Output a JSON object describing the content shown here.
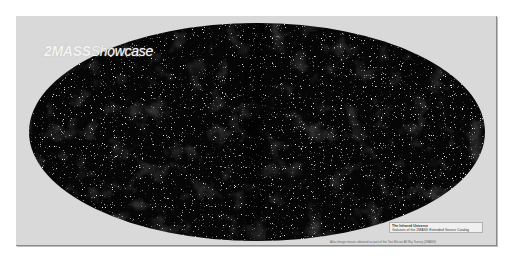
{
  "logo": {
    "prefix": "2MASS",
    "suffix": "Showcase"
  },
  "title_box": {
    "title": "The Infrared Universe",
    "subtitle": "Galaxies of the 2MASS Extended Source Catalog"
  },
  "credit": "Atlas Image mosaic obtained as part of the Two Micron All Sky Survey (2MASS)",
  "colors": {
    "frame": "#d9d9d9",
    "sky": "#050505",
    "stars": "#e8e8e8"
  }
}
